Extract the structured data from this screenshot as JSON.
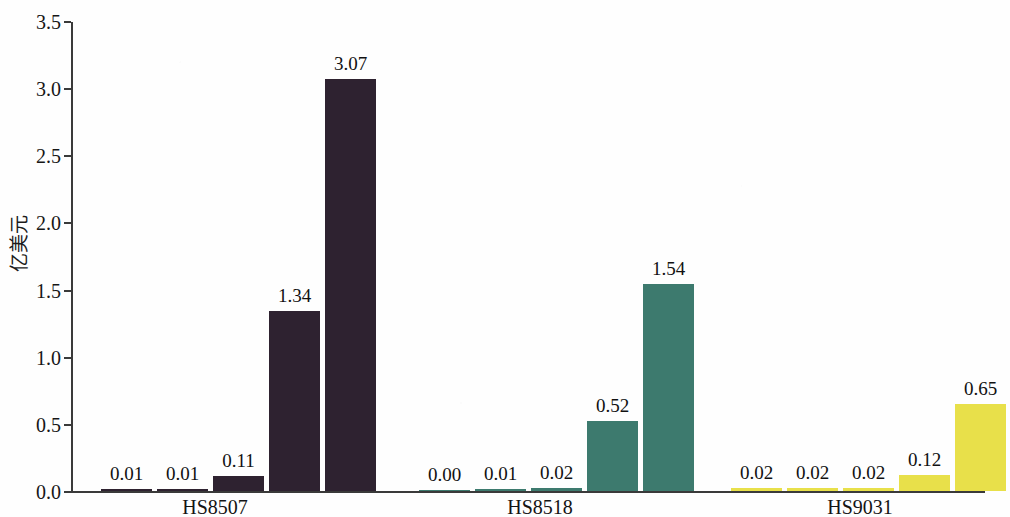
{
  "chart_data": {
    "type": "bar",
    "title": "",
    "subtitle": "",
    "xlabel": "",
    "ylabel": "亿美元",
    "ylim": [
      0.0,
      3.5
    ],
    "ytick_labels": [
      "0.0",
      "0.5",
      "1.0",
      "1.5",
      "2.0",
      "2.5",
      "3.0",
      "3.5"
    ],
    "ytick_values": [
      0.0,
      0.5,
      1.0,
      1.5,
      2.0,
      2.5,
      3.0,
      3.5
    ],
    "grid": false,
    "legend": false,
    "legend_position": "none",
    "categories": [
      "HS8507",
      "HS8518",
      "HS9031"
    ],
    "bars_per_group": 5,
    "groups": [
      {
        "label": "HS8507",
        "color": "#2e2230",
        "values": [
          0.01,
          0.01,
          0.11,
          1.34,
          3.07
        ],
        "value_labels": [
          "0.01",
          "0.01",
          "0.11",
          "1.34",
          "3.07"
        ]
      },
      {
        "label": "HS8518",
        "color": "#3d7a6e",
        "values": [
          0.0,
          0.01,
          0.02,
          0.52,
          1.54
        ],
        "value_labels": [
          "0.00",
          "0.01",
          "0.02",
          "0.52",
          "1.54"
        ]
      },
      {
        "label": "HS9031",
        "color": "#e8e04a",
        "values": [
          0.02,
          0.02,
          0.02,
          0.12,
          0.65
        ],
        "value_labels": [
          "0.02",
          "0.02",
          "0.02",
          "0.12",
          "0.65"
        ]
      }
    ],
    "colors": {
      "group_1": "#2e2230",
      "group_2": "#3d7a6e",
      "group_3": "#e8e04a",
      "axis": "#3a3a3a",
      "text": "#141414",
      "background": "#fefefe"
    }
  }
}
